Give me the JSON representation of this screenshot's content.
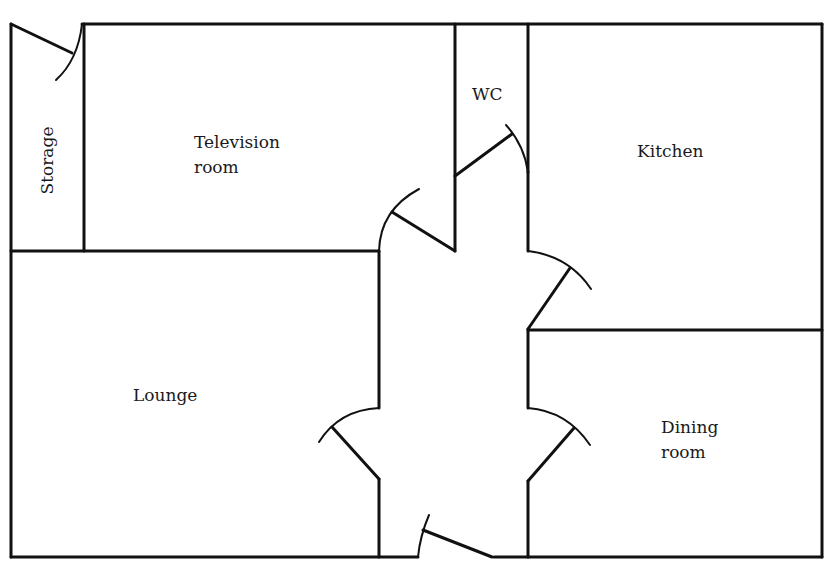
{
  "diagram": {
    "type": "floor-plan",
    "colors": {
      "background": "#ffffff",
      "lines": "#111111",
      "text": "#1a1a1a"
    },
    "rooms": [
      {
        "id": "storage",
        "label": "Storage",
        "orientation": "vertical"
      },
      {
        "id": "television-room",
        "label": "Television\nroom"
      },
      {
        "id": "wc",
        "label": "WC"
      },
      {
        "id": "kitchen",
        "label": "Kitchen"
      },
      {
        "id": "lounge",
        "label": "Lounge"
      },
      {
        "id": "dining-room",
        "label": "Dining\nroom"
      }
    ],
    "doors": [
      {
        "id": "storage-door",
        "connects": [
          "storage",
          "outside-top"
        ]
      },
      {
        "id": "television-room-door",
        "connects": [
          "television-room",
          "hallway"
        ]
      },
      {
        "id": "wc-door",
        "connects": [
          "wc",
          "hallway"
        ]
      },
      {
        "id": "kitchen-door",
        "connects": [
          "kitchen",
          "hallway"
        ]
      },
      {
        "id": "lounge-door",
        "connects": [
          "lounge",
          "hallway"
        ]
      },
      {
        "id": "dining-room-door",
        "connects": [
          "dining-room",
          "hallway"
        ]
      },
      {
        "id": "front-door",
        "connects": [
          "hallway",
          "outside"
        ]
      }
    ]
  }
}
